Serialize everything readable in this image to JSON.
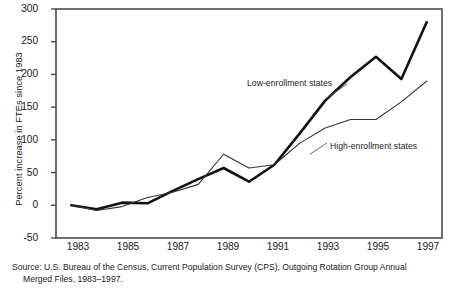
{
  "chart_data": {
    "type": "line",
    "title": "",
    "xlabel": "",
    "ylabel": "Percent increase in FTEs since 1983",
    "x": [
      1983,
      1984,
      1985,
      1986,
      1987,
      1988,
      1989,
      1990,
      1991,
      1992,
      1993,
      1994,
      1995,
      1996,
      1997
    ],
    "xticks": [
      "1983",
      "1985",
      "1987",
      "1989",
      "1991",
      "1993",
      "1995",
      "1997"
    ],
    "xtick_values": [
      1983,
      1985,
      1987,
      1989,
      1991,
      1993,
      1995,
      1997
    ],
    "yticks": [
      "-50",
      "0",
      "50",
      "100",
      "150",
      "200",
      "250",
      "300"
    ],
    "ytick_values": [
      -50,
      0,
      50,
      100,
      150,
      200,
      250,
      300
    ],
    "xlim": [
      1982.4,
      1997.6
    ],
    "ylim": [
      -50,
      300
    ],
    "grid": false,
    "legend_position": "inline-annotations",
    "series": [
      {
        "name": "Low-enrollment states",
        "style": "thick",
        "color": "#111111",
        "values": [
          0,
          -6,
          4,
          3,
          22,
          40,
          57,
          36,
          62,
          110,
          160,
          196,
          227,
          193,
          280
        ]
      },
      {
        "name": "High-enrollment states",
        "style": "thin",
        "color": "#333333",
        "values": [
          0,
          -8,
          -2,
          12,
          20,
          32,
          78,
          57,
          62,
          95,
          118,
          131,
          131,
          158,
          190
        ]
      }
    ],
    "annotations": [
      {
        "text": "Low-enrollment states",
        "target_x": 1993.1,
        "target_y": 165
      },
      {
        "text": "High-enrollment states",
        "target_x": 1992.4,
        "target_y": 78
      }
    ]
  },
  "source": {
    "line1": "Source: U.S. Bureau of the Census, Current Population Survey (CPS), Outgoing Rotation Group Annual",
    "line2": "Merged Files, 1983–1997."
  }
}
